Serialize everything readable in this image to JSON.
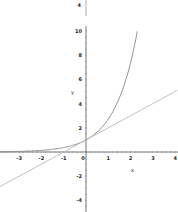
{
  "chart_data": {
    "type": "line",
    "title": "",
    "xlabel": "x",
    "ylabel": "y",
    "xlim": [
      -3.9,
      4.1
    ],
    "ylim": [
      -5,
      12.5
    ],
    "grid": false,
    "x_ticks": [
      "-3",
      "-2",
      "-1",
      "0",
      "1",
      "2",
      "3",
      "4"
    ],
    "y_ticks": [
      "-4",
      "-2",
      "2",
      "4",
      "6",
      "8",
      "10"
    ],
    "top_stub_label": "4",
    "series": [
      {
        "name": "exponential curve",
        "formula": "y = e^x",
        "color": "#888888",
        "x": [
          -3.9,
          -3,
          -2,
          -1,
          0,
          1,
          2,
          2.3
        ],
        "y": [
          0.02,
          0.05,
          0.14,
          0.37,
          1.0,
          2.72,
          7.39,
          9.97
        ]
      },
      {
        "name": "tangent line",
        "formula": "y = x + 1",
        "color": "#bbbbbb",
        "x": [
          -3.9,
          4.1
        ],
        "y": [
          -2.9,
          5.1
        ]
      }
    ]
  },
  "axes": {
    "x_label": "x",
    "y_label": "y"
  }
}
